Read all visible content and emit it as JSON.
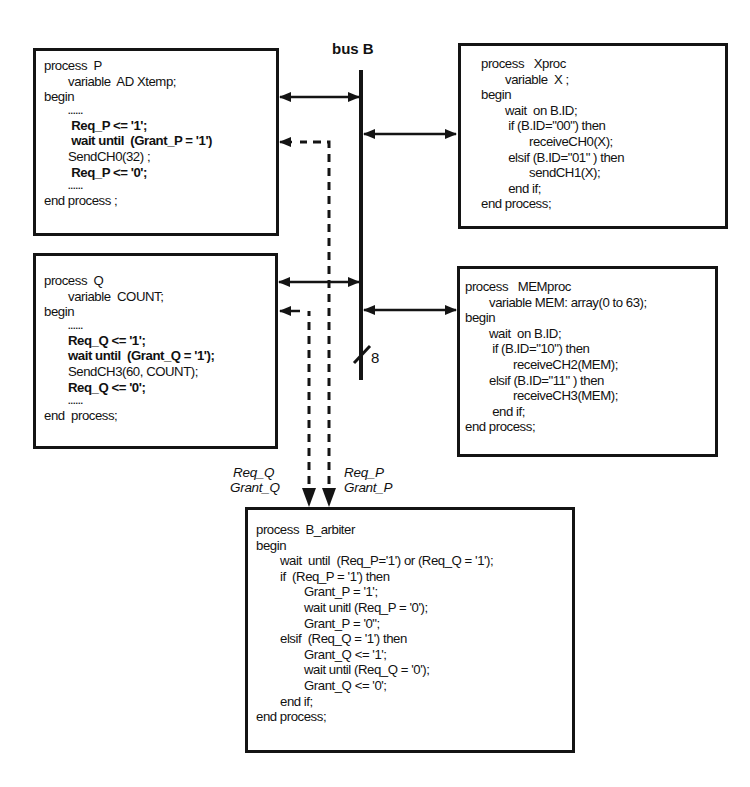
{
  "bus": {
    "title": "bus B",
    "width_label": "8"
  },
  "process_p": {
    "lines": [
      {
        "text": "process  P",
        "indent": 0,
        "bold": false
      },
      {
        "text": "variable  AD Xtemp;",
        "indent": 1,
        "bold": false
      },
      {
        "text": "begin",
        "indent": 0,
        "bold": false
      },
      {
        "text": "......",
        "indent": 1,
        "bold": true,
        "dots": true
      },
      {
        "text": " Req_P <= '1';",
        "indent": 1,
        "bold": true
      },
      {
        "text": " wait until  (Grant_P = '1')",
        "indent": 1,
        "bold": true
      },
      {
        "text": "SendCH0(32) ;",
        "indent": 1,
        "bold": false
      },
      {
        "text": " Req_P <= '0';",
        "indent": 1,
        "bold": true
      },
      {
        "text": "......",
        "indent": 1,
        "bold": true,
        "dots": true
      },
      {
        "text": "end process ;",
        "indent": 0,
        "bold": false
      }
    ]
  },
  "process_q": {
    "lines": [
      {
        "text": "process  Q",
        "indent": 0,
        "bold": false
      },
      {
        "text": "variable  COUNT;",
        "indent": 1,
        "bold": false
      },
      {
        "text": "begin",
        "indent": 0,
        "bold": false
      },
      {
        "text": "......",
        "indent": 1,
        "bold": true,
        "dots": true
      },
      {
        "text": "Req_Q <= '1';",
        "indent": 1,
        "bold": true
      },
      {
        "text": "wait until  (Grant_Q = '1');",
        "indent": 1,
        "bold": true
      },
      {
        "text": "SendCH3(60, COUNT);",
        "indent": 1,
        "bold": false
      },
      {
        "text": "Req_Q <= '0';",
        "indent": 1,
        "bold": true
      },
      {
        "text": "......",
        "indent": 1,
        "bold": true,
        "dots": true
      },
      {
        "text": "end  process;",
        "indent": 0,
        "bold": false
      }
    ]
  },
  "process_xproc": {
    "lines": [
      {
        "text": "process   Xproc",
        "indent": 0,
        "bold": false
      },
      {
        "text": "variable  X ;",
        "indent": 1,
        "bold": false
      },
      {
        "text": "begin",
        "indent": 0,
        "bold": false
      },
      {
        "text": "wait  on B.ID;",
        "indent": 1,
        "bold": false
      },
      {
        "text": " if (B.ID=\"00\") then",
        "indent": 1,
        "bold": false
      },
      {
        "text": "receiveCH0(X);",
        "indent": 2,
        "bold": false
      },
      {
        "text": " elsif (B.ID=\"01\" ) then",
        "indent": 1,
        "bold": false
      },
      {
        "text": "sendCH1(X);",
        "indent": 2,
        "bold": false
      },
      {
        "text": " end if;",
        "indent": 1,
        "bold": false
      },
      {
        "text": "end process;",
        "indent": 0,
        "bold": false
      }
    ]
  },
  "process_memproc": {
    "lines": [
      {
        "text": "process   MEMproc",
        "indent": 0,
        "bold": false
      },
      {
        "text": "variable MEM: array(0 to 63);",
        "indent": 1,
        "bold": false
      },
      {
        "text": "begin",
        "indent": 0,
        "bold": false
      },
      {
        "text": "wait  on B.ID;",
        "indent": 1,
        "bold": false
      },
      {
        "text": " if (B.ID=\"10\") then",
        "indent": 1,
        "bold": false
      },
      {
        "text": "receiveCH2(MEM);",
        "indent": 2,
        "bold": false
      },
      {
        "text": "elsif (B.ID=\"11\" ) then",
        "indent": 1,
        "bold": false
      },
      {
        "text": "receiveCH3(MEM);",
        "indent": 2,
        "bold": false
      },
      {
        "text": " end if;",
        "indent": 1,
        "bold": false
      },
      {
        "text": "end process;",
        "indent": 0,
        "bold": false
      }
    ]
  },
  "process_arbiter": {
    "lines": [
      {
        "text": "process  B_arbiter",
        "indent": 0,
        "bold": false
      },
      {
        "text": "begin",
        "indent": 0,
        "bold": false
      },
      {
        "text": "wait  until  (Req_P='1') or (Req_Q = '1');",
        "indent": 1,
        "bold": false
      },
      {
        "text": "if  (Req_P = '1') then",
        "indent": 1,
        "bold": false
      },
      {
        "text": "Grant_P = '1';",
        "indent": 2,
        "bold": false
      },
      {
        "text": "wait unitl (Req_P = '0');",
        "indent": 2,
        "bold": false
      },
      {
        "text": "Grant_P = '0\";",
        "indent": 2,
        "bold": false
      },
      {
        "text": "elsif  (Req_Q = '1') then",
        "indent": 1,
        "bold": false
      },
      {
        "text": "Grant_Q <= '1';",
        "indent": 2,
        "bold": false
      },
      {
        "text": "wait until (Req_Q = '0');",
        "indent": 2,
        "bold": false
      },
      {
        "text": "Grant_Q <= '0';",
        "indent": 2,
        "bold": false
      },
      {
        "text": "end if;",
        "indent": 1,
        "bold": false
      },
      {
        "text": "end process;",
        "indent": 0,
        "bold": false
      }
    ]
  },
  "signals": {
    "q_request": "Req_Q",
    "q_grant": "Grant_Q",
    "p_request": "Req_P",
    "p_grant": "Grant_P"
  },
  "colors": {
    "ink": "#141414",
    "background": "#ffffff"
  }
}
